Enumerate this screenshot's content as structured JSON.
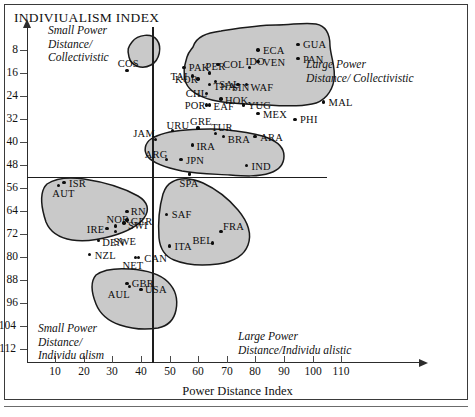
{
  "chart_title": "INDIVIUALISM INDEX",
  "axis": {
    "x_title": "Power Distance Index",
    "x_ticks": [
      10,
      20,
      30,
      40,
      50,
      60,
      70,
      80,
      90,
      100,
      110
    ],
    "y_ticks": [
      8,
      16,
      24,
      32,
      40,
      48,
      56,
      64,
      72,
      80,
      88,
      96,
      104,
      112
    ],
    "x_range": [
      0,
      120
    ],
    "y_range": [
      0,
      116
    ]
  },
  "quadrant_labels": {
    "top_left": "Small Power\nDistance/\nCollectivistic",
    "top_left_l1": "Small Power",
    "top_left_l2": "Distance/",
    "top_left_l3": "Collectivistic",
    "top_right_l1": "Large Power",
    "top_right_l2": "Distance/ Collectivistic",
    "bottom_left_l1": "Small Power",
    "bottom_left_l2": "Distance/",
    "bottom_left_l3": "Individu alism",
    "bottom_right_l1": "Large Power",
    "bottom_right_l2": "Distance/Individu alistic"
  },
  "colors": {
    "cluster_fill": "#c9c9c9",
    "cluster_stroke": "#1a1a1a",
    "axis": "#2c2c2c",
    "divider": "#1d1d1d",
    "text": "#111111",
    "frame": "#3a3a3a"
  },
  "reference_lines": {
    "vertical_x_value": 44,
    "horizontal_y_value": 52
  },
  "chart_data": {
    "type": "scatter",
    "title": "INDIVIUALISM INDEX",
    "xlabel": "Power Distance Index",
    "ylabel": "Individualism Index",
    "xlim": [
      0,
      120
    ],
    "ylim": [
      0,
      116
    ],
    "grid": false,
    "legend": "none",
    "y_axis_inverted": true,
    "note": "Individualism Index increases downward on the printed y-axis (8 at top, 112 at bottom).",
    "points": [
      {
        "label": "COS",
        "x": 35,
        "y": 15
      },
      {
        "label": "PAK",
        "x": 55,
        "y": 14
      },
      {
        "label": "COL",
        "x": 67,
        "y": 13
      },
      {
        "label": "ECA",
        "x": 81,
        "y": 8
      },
      {
        "label": "VEN",
        "x": 81,
        "y": 12
      },
      {
        "label": "GUA",
        "x": 95,
        "y": 6
      },
      {
        "label": "PAN",
        "x": 95,
        "y": 11
      },
      {
        "label": "TAI",
        "x": 58,
        "y": 17
      },
      {
        "label": "SAL",
        "x": 66,
        "y": 19
      },
      {
        "label": "PER",
        "x": 64,
        "y": 16
      },
      {
        "label": "IDO",
        "x": 78,
        "y": 14
      },
      {
        "label": "SIN",
        "x": 74,
        "y": 20
      },
      {
        "label": "WAF",
        "x": 77,
        "y": 20
      },
      {
        "label": "KOR",
        "x": 60,
        "y": 18
      },
      {
        "label": "CHL",
        "x": 63,
        "y": 23
      },
      {
        "label": "THA",
        "x": 64,
        "y": 20
      },
      {
        "label": "HOK",
        "x": 68,
        "y": 25
      },
      {
        "label": "POR",
        "x": 63,
        "y": 27
      },
      {
        "label": "EAF",
        "x": 64,
        "y": 27
      },
      {
        "label": "YUG",
        "x": 76,
        "y": 27
      },
      {
        "label": "MEX",
        "x": 81,
        "y": 30
      },
      {
        "label": "MAL",
        "x": 104,
        "y": 26
      },
      {
        "label": "PHI",
        "x": 94,
        "y": 32
      },
      {
        "label": "GRE",
        "x": 60,
        "y": 35
      },
      {
        "label": "JAM",
        "x": 45,
        "y": 39
      },
      {
        "label": "URU",
        "x": 51,
        "y": 36
      },
      {
        "label": "TUR",
        "x": 66,
        "y": 37
      },
      {
        "label": "BRA",
        "x": 69,
        "y": 38
      },
      {
        "label": "ARA",
        "x": 80,
        "y": 38
      },
      {
        "label": "IRA",
        "x": 58,
        "y": 41
      },
      {
        "label": "ARG",
        "x": 49,
        "y": 46
      },
      {
        "label": "JPN",
        "x": 54,
        "y": 46
      },
      {
        "label": "IND",
        "x": 77,
        "y": 48
      },
      {
        "label": "ISR",
        "x": 13,
        "y": 54
      },
      {
        "label": "AUT",
        "x": 11,
        "y": 55
      },
      {
        "label": "SPA",
        "x": 57,
        "y": 51
      },
      {
        "label": "RN",
        "x": 35,
        "y": 64
      },
      {
        "label": "GER",
        "x": 35,
        "y": 67
      },
      {
        "label": "NOR",
        "x": 31,
        "y": 69
      },
      {
        "label": "SWI",
        "x": 34,
        "y": 68
      },
      {
        "label": "IRE",
        "x": 28,
        "y": 70
      },
      {
        "label": "SWE",
        "x": 31,
        "y": 71
      },
      {
        "label": "DEN",
        "x": 25,
        "y": 74
      },
      {
        "label": "SAF",
        "x": 49,
        "y": 65
      },
      {
        "label": "FRA",
        "x": 68,
        "y": 71
      },
      {
        "label": "BEL",
        "x": 65,
        "y": 75
      },
      {
        "label": "ITA",
        "x": 50,
        "y": 76
      },
      {
        "label": "NZL",
        "x": 22,
        "y": 79
      },
      {
        "label": "NET",
        "x": 38,
        "y": 80
      },
      {
        "label": "CAN",
        "x": 39,
        "y": 80
      },
      {
        "label": "GBR",
        "x": 35,
        "y": 89
      },
      {
        "label": "AUL",
        "x": 36,
        "y": 90
      },
      {
        "label": "USA",
        "x": 40,
        "y": 91
      }
    ],
    "clusters": [
      {
        "name": "costa-rica-cluster",
        "members": [
          "COS"
        ]
      },
      {
        "name": "collectivistic-cluster",
        "members": [
          "PAK",
          "COL",
          "ECA",
          "VEN",
          "GUA",
          "PAN",
          "TAI",
          "SAL",
          "PER",
          "IDO",
          "SIN",
          "WAF",
          "KOR",
          "CHL",
          "THA",
          "HOK",
          "POR",
          "EAF",
          "YUG",
          "MEX",
          "MAL",
          "PHI"
        ]
      },
      {
        "name": "middle-cluster",
        "members": [
          "JAM",
          "URU",
          "GRE",
          "TUR",
          "BRA",
          "ARA",
          "IRA",
          "ARG",
          "JPN",
          "IND"
        ]
      },
      {
        "name": "europe-cluster",
        "members": [
          "ISR",
          "AUT",
          "RN",
          "GER",
          "NOR",
          "SWI",
          "IRE",
          "SWE",
          "DEN"
        ]
      },
      {
        "name": "latin-europe-cluster",
        "members": [
          "SPA",
          "SAF",
          "FRA",
          "BEL",
          "ITA"
        ]
      },
      {
        "name": "anglo-cluster",
        "members": [
          "NZL",
          "NET",
          "CAN",
          "GBR",
          "AUL",
          "USA"
        ]
      }
    ]
  }
}
